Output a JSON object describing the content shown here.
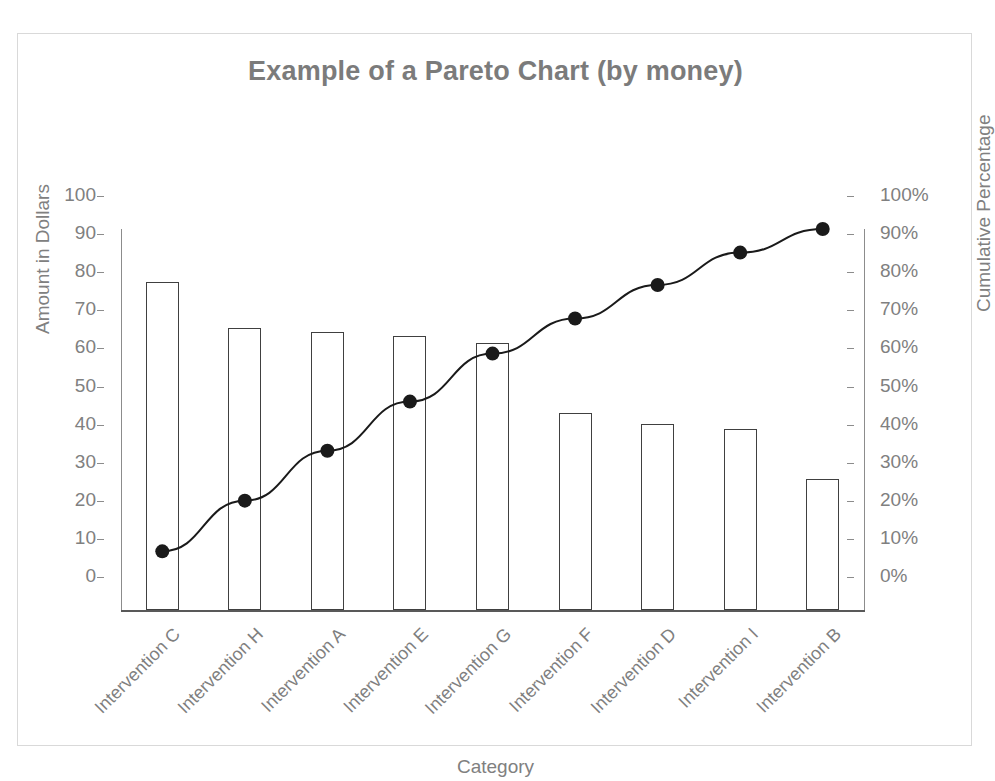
{
  "chart_data": {
    "type": "bar",
    "title": "Example of a Pareto Chart (by money)",
    "xlabel": "Category",
    "ylabel": "Amount in Dollars",
    "y2label": "Cumulative Percentage",
    "categories": [
      "Intervention C",
      "Intervention H",
      "Intervention A",
      "Intervention E",
      "Intervention G",
      "Intervention F",
      "Intervention D",
      "Intervention I",
      "Intervention B"
    ],
    "values": [
      86,
      74,
      73,
      72,
      70,
      51.7,
      48.8,
      47.5,
      34.5
    ],
    "cumulative_percent": [
      15.4,
      28.7,
      41.8,
      54.7,
      67.3,
      76.5,
      85.3,
      93.8,
      100
    ],
    "ylim": [
      0,
      100
    ],
    "y2lim": [
      0,
      100
    ],
    "ytick_labels": [
      "100",
      "90",
      "80",
      "70",
      "60",
      "50",
      "40",
      "30",
      "20",
      "10",
      "0"
    ],
    "ytick_values": [
      100,
      90,
      80,
      70,
      60,
      50,
      40,
      30,
      20,
      10,
      0
    ],
    "y2tick_labels": [
      "100%",
      "90%",
      "80%",
      "70%",
      "60%",
      "50%",
      "40%",
      "30%",
      "20%",
      "10%",
      "0%"
    ],
    "y2tick_values": [
      100,
      90,
      80,
      70,
      60,
      50,
      40,
      30,
      20,
      10,
      0
    ],
    "grid": false,
    "legend": "none",
    "series": [
      {
        "name": "Amount in Dollars",
        "type": "bar",
        "axis": "left",
        "values": [
          86,
          74,
          73,
          72,
          70,
          51.7,
          48.8,
          47.5,
          34.5
        ]
      },
      {
        "name": "Cumulative Percentage",
        "type": "line",
        "axis": "right",
        "values": [
          15.4,
          28.7,
          41.8,
          54.7,
          67.3,
          76.5,
          85.3,
          93.8,
          100
        ]
      }
    ],
    "colors": {
      "title": "#7b7b7b",
      "tick_label": "#808080",
      "bar_outline": "#404040",
      "bar_fill": "#ffffff",
      "line": "#1a1a1a",
      "marker": "#1a1a1a",
      "axis": "#8c8c8c",
      "frame_border": "#d9d9d9"
    }
  }
}
